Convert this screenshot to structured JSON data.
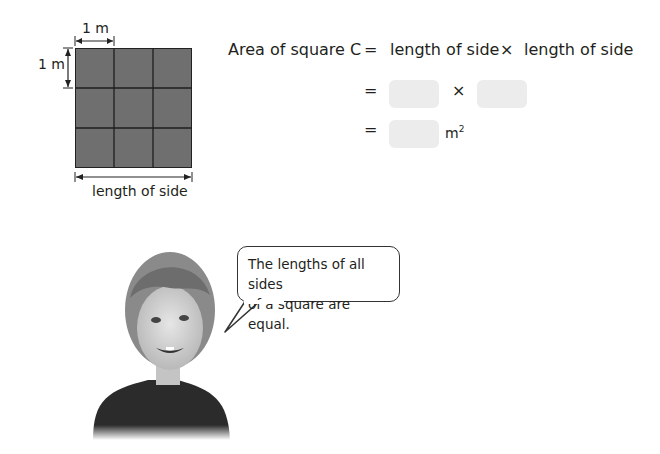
{
  "diagram": {
    "top_unit_label": "1 m",
    "left_unit_label": "1 m",
    "bottom_label": "length of side",
    "grid_rows": 3,
    "grid_cols": 3,
    "fill_color": "#6f6f6f"
  },
  "equation": {
    "line1_lhs": "Area of square C",
    "line1_eq": "=",
    "line1_term1": "length of side",
    "line1_op": "×",
    "line1_term2": "length of side",
    "line2_eq": "=",
    "line2_op": "×",
    "line3_eq": "=",
    "line3_unit": "m",
    "line3_unit_sup": "2",
    "blank_color": "#ececec"
  },
  "speech_bubble": {
    "line1": "The lengths of all sides",
    "line2": "of a square are equal."
  }
}
